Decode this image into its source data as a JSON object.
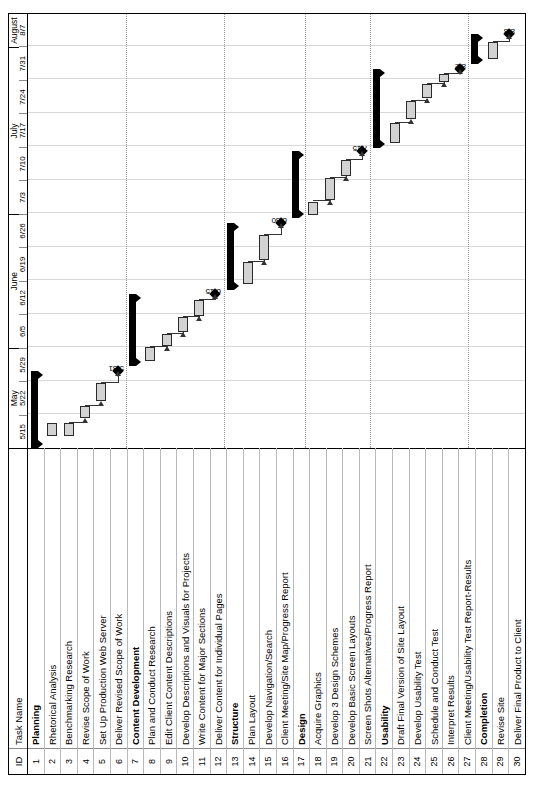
{
  "table": {
    "headers": {
      "id": "ID",
      "task_name": "Task Name"
    },
    "rows": [
      {
        "id": "1",
        "name": "Planning",
        "type": "summary"
      },
      {
        "id": "2",
        "name": "Rhetorical Analysis",
        "type": "task"
      },
      {
        "id": "3",
        "name": "Benchmarking Research",
        "type": "task"
      },
      {
        "id": "4",
        "name": "Revise Scope of Work",
        "type": "task"
      },
      {
        "id": "5",
        "name": "Set Up Production Web Server",
        "type": "task"
      },
      {
        "id": "6",
        "name": "Deliver Revised Scope of Work",
        "type": "milestone"
      },
      {
        "id": "7",
        "name": "Content Development",
        "type": "summary"
      },
      {
        "id": "8",
        "name": "Plan and Conduct Research",
        "type": "task"
      },
      {
        "id": "9",
        "name": "Edit Client Content Descriptions",
        "type": "task"
      },
      {
        "id": "10",
        "name": "Develop Descriptions and Visuals for Projects",
        "type": "task"
      },
      {
        "id": "11",
        "name": "Write Content for Major Sections",
        "type": "task"
      },
      {
        "id": "12",
        "name": "Deliver Content for Individual Pages",
        "type": "milestone"
      },
      {
        "id": "13",
        "name": "Structure",
        "type": "summary"
      },
      {
        "id": "14",
        "name": "Plan Layout",
        "type": "task"
      },
      {
        "id": "15",
        "name": "Develop Navigation/Search",
        "type": "task"
      },
      {
        "id": "16",
        "name": "Client Meeting/Site Map/Progress Report",
        "type": "milestone"
      },
      {
        "id": "17",
        "name": "Design",
        "type": "summary"
      },
      {
        "id": "18",
        "name": "Acquire Graphics",
        "type": "task"
      },
      {
        "id": "19",
        "name": "Develop 3 Design Schemes",
        "type": "task"
      },
      {
        "id": "20",
        "name": "Develop Basic Screen Layouts",
        "type": "task"
      },
      {
        "id": "21",
        "name": "Screen Shots Alternatives/Progress Report",
        "type": "milestone"
      },
      {
        "id": "22",
        "name": "Usability",
        "type": "summary"
      },
      {
        "id": "23",
        "name": "Draft Final Version of Site Layout",
        "type": "task"
      },
      {
        "id": "24",
        "name": "Develop Usability Test",
        "type": "task"
      },
      {
        "id": "25",
        "name": "Schedule and Conduct Test",
        "type": "task"
      },
      {
        "id": "26",
        "name": "Interpret Results",
        "type": "task"
      },
      {
        "id": "27",
        "name": "Client Meeting/Usability Test Report-Results",
        "type": "milestone"
      },
      {
        "id": "28",
        "name": "Completion",
        "type": "summary"
      },
      {
        "id": "29",
        "name": "Revise Site",
        "type": "task"
      },
      {
        "id": "30",
        "name": "Deliver Final Product to Client",
        "type": "milestone"
      }
    ]
  },
  "timescale": {
    "months": [
      {
        "label": "May",
        "weeks": 3
      },
      {
        "label": "June",
        "weeks": 4
      },
      {
        "label": "July",
        "weeks": 5
      },
      {
        "label": "August",
        "weeks": 1
      }
    ],
    "weeks": [
      "5/15",
      "5/22",
      "5/29",
      "6/5",
      "6/12",
      "6/19",
      "6/26",
      "7/3",
      "7/10",
      "7/17",
      "7/24",
      "7/31",
      "8/7"
    ]
  },
  "chart_data": {
    "type": "bar",
    "xlabel": "",
    "ylabel": "Task",
    "x_axis_weeks": [
      "5/15",
      "5/22",
      "5/29",
      "6/5",
      "6/12",
      "6/19",
      "6/26",
      "7/3",
      "7/10",
      "7/17",
      "7/24",
      "7/31",
      "8/7"
    ],
    "grid": true,
    "legend": "none",
    "bars": [
      {
        "id": "1",
        "name": "Planning",
        "type": "summary",
        "start_week": 0.0,
        "end_week": 2.3
      },
      {
        "id": "2",
        "name": "Rhetorical Analysis",
        "type": "task",
        "start_week": 0.35,
        "end_week": 0.75
      },
      {
        "id": "3",
        "name": "Benchmarking Research",
        "type": "task",
        "start_week": 0.35,
        "end_week": 0.75
      },
      {
        "id": "4",
        "name": "Revise Scope of Work",
        "type": "task",
        "start_week": 0.9,
        "end_week": 1.25
      },
      {
        "id": "5",
        "name": "Set Up Production Web Server",
        "type": "task",
        "start_week": 1.4,
        "end_week": 1.95
      },
      {
        "id": "6",
        "name": "Deliver Revised Scope of Work",
        "type": "milestone",
        "start_week": 2.3,
        "end_week": 2.3,
        "label": "5/31"
      },
      {
        "id": "7",
        "name": "Content Development",
        "type": "summary",
        "start_week": 2.45,
        "end_week": 4.6
      },
      {
        "id": "8",
        "name": "Plan and Conduct Research",
        "type": "task",
        "start_week": 2.6,
        "end_week": 3.0
      },
      {
        "id": "9",
        "name": "Edit Client Content Descriptions",
        "type": "task",
        "start_week": 3.05,
        "end_week": 3.4
      },
      {
        "id": "10",
        "name": "Develop Descriptions and Visuals for Projects",
        "type": "task",
        "start_week": 3.45,
        "end_week": 3.9
      },
      {
        "id": "11",
        "name": "Write Content for Major Sections",
        "type": "task",
        "start_week": 3.95,
        "end_week": 4.4
      },
      {
        "id": "12",
        "name": "Deliver Content for Individual Pages",
        "type": "milestone",
        "start_week": 4.6,
        "end_week": 4.6,
        "label": "6/15"
      },
      {
        "id": "13",
        "name": "Structure",
        "type": "summary",
        "start_week": 4.7,
        "end_week": 6.7
      },
      {
        "id": "14",
        "name": "Plan Layout",
        "type": "task",
        "start_week": 4.9,
        "end_week": 5.55
      },
      {
        "id": "15",
        "name": "Develop Navigation/Search",
        "type": "task",
        "start_week": 5.6,
        "end_week": 6.35
      },
      {
        "id": "16",
        "name": "Client Meeting/Site Map/Progress Report",
        "type": "milestone",
        "start_week": 6.7,
        "end_week": 6.7,
        "label": "6/30"
      },
      {
        "id": "17",
        "name": "Design",
        "type": "summary",
        "start_week": 6.85,
        "end_week": 8.85
      },
      {
        "id": "18",
        "name": "Acquire Graphics",
        "type": "task",
        "start_week": 6.95,
        "end_week": 7.35
      },
      {
        "id": "19",
        "name": "Develop 3 Design Schemes",
        "type": "task",
        "start_week": 7.4,
        "end_week": 8.05
      },
      {
        "id": "20",
        "name": "Develop Basic Screen Layouts",
        "type": "task",
        "start_week": 8.1,
        "end_week": 8.6
      },
      {
        "id": "21",
        "name": "Screen Shots Alternatives/Progress Report",
        "type": "milestone",
        "start_week": 8.85,
        "end_week": 8.85,
        "label": "7/15"
      },
      {
        "id": "22",
        "name": "Usability",
        "type": "summary",
        "start_week": 8.95,
        "end_week": 11.3
      },
      {
        "id": "23",
        "name": "Draft Final Version of Site Layout",
        "type": "task",
        "start_week": 9.1,
        "end_week": 9.7
      },
      {
        "id": "24",
        "name": "Develop Usability Test",
        "type": "task",
        "start_week": 9.8,
        "end_week": 10.35
      },
      {
        "id": "25",
        "name": "Schedule and Conduct Test",
        "type": "task",
        "start_week": 10.45,
        "end_week": 10.85
      },
      {
        "id": "26",
        "name": "Interpret Results",
        "type": "task",
        "start_week": 10.9,
        "end_week": 11.15
      },
      {
        "id": "27",
        "name": "Client Meeting/Usability Test Report-Results",
        "type": "milestone",
        "start_week": 11.3,
        "end_week": 11.3,
        "label": "8/2"
      },
      {
        "id": "28",
        "name": "Completion",
        "type": "summary",
        "start_week": 11.45,
        "end_week": 12.35
      },
      {
        "id": "29",
        "name": "Revise Site",
        "type": "task",
        "start_week": 11.6,
        "end_week": 12.1
      },
      {
        "id": "30",
        "name": "Deliver Final Product to Client",
        "type": "milestone",
        "start_week": 12.35,
        "end_week": 12.35,
        "label": "8/8"
      }
    ],
    "milestone_labels": [
      "5/31",
      "6/15",
      "6/30",
      "7/15",
      "8/2",
      "8/8"
    ]
  },
  "colors": {
    "bar_fill": "#d2d2d2",
    "bar_border": "#2b2b2b",
    "summary_bar": "#000000",
    "milestone": "#000000",
    "grid": "#d8d8d8",
    "frame": "#000000"
  }
}
